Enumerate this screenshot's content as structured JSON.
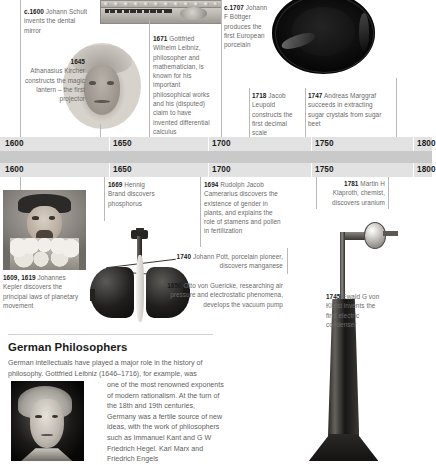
{
  "colors": {
    "axis_bar": "#e2e2e2",
    "axis_gap": "#c9c9c9",
    "body_text": "#6b6b6b",
    "year_text": "#1a1a1a",
    "leader_line": "#b9b9b9"
  },
  "timeline_top": {
    "labels": [
      "1600",
      "1650",
      "1700",
      "1750",
      "1800"
    ],
    "entries": [
      {
        "id": "dental-mirror",
        "year": "c.1600",
        "text": " Johann Schult invents the dental mirror"
      },
      {
        "id": "magic-lantern",
        "year": "1645",
        "text": "Athanasius Kircher constructs the magic lantern – the first projector"
      },
      {
        "id": "leibniz-calculus",
        "year": "1671",
        "text": " Gottfried Wilhelm Leibniz, philosopher and mathematician, is known for his important philosophical works and his (disputed) claim to have invented differential calculus"
      },
      {
        "id": "european-porcelain",
        "year": "c.1707",
        "text": " Johann F Böttger produces the first European porcelain"
      },
      {
        "id": "decimal-scale",
        "year": "1718",
        "text": " Jacob Leupold constructs the first decimal scale"
      },
      {
        "id": "sugar-beet",
        "year": "1747",
        "text": " Andreas Marggraf succeeds in extracting sugar crystals from sugar beet"
      }
    ]
  },
  "timeline_bottom": {
    "labels": [
      "1600",
      "1650",
      "1700",
      "1750",
      "1800"
    ],
    "entries": [
      {
        "id": "kepler-laws",
        "year": "1609, 1619",
        "text": " Johannes Kepler discovers the principal laws of planetary movement"
      },
      {
        "id": "phosphorus",
        "year": "1669",
        "text": " Hennig Brand discovers phosphorus"
      },
      {
        "id": "plant-gender",
        "year": "1694",
        "text": " Rudolph Jacob Camerarius discovers the existence of gender in plants, and explains the role of stamens and pollen in fertilization"
      },
      {
        "id": "manganese",
        "year": "1740",
        "text": " Johann Pott, porcelain pioneer, discovers manganese"
      },
      {
        "id": "vacuum-pump",
        "year": "1650",
        "text": " Otto von Guericke, researching air pressure and electrostatic phenomena, develops the vacuum pump"
      },
      {
        "id": "uranium",
        "year": "1781",
        "text": " Martin H Klaproth, chemist, discovers uranium"
      },
      {
        "id": "electric-condenser",
        "year": "1745",
        "text": " Ewald G von Kleist invents the first electric condenser"
      }
    ]
  },
  "feature": {
    "title": "German Philosophers",
    "paragraph_lead": "German intellectuals have played a major role in the history of philosophy. Gottfried Leibniz (1646–1716), for example, was",
    "paragraph_wrap": "one of the most renowned exponents of modern rationalism. At the turn of the 18th and 19th centuries, Germany was a fertile source of new ideas, with the work of philosophers such as Immanuel Kant and G W Friedrich Hegel. Karl Marx and Friedrich Engels"
  },
  "illustrations": [
    {
      "id": "leibniz-calculating-machine",
      "name": "calculating-machine-illustration"
    },
    {
      "id": "kircher-portrait",
      "name": "kircher-bust-portrait"
    },
    {
      "id": "bottger-plate",
      "name": "black-porcelain-plate-photo"
    },
    {
      "id": "kepler-portrait",
      "name": "kepler-portrait"
    },
    {
      "id": "magdeburg-hemispheres",
      "name": "vacuum-pump-hemispheres-illustration"
    },
    {
      "id": "kleist-condenser",
      "name": "electric-condenser-illustration"
    },
    {
      "id": "hegel-portrait",
      "name": "hegel-portrait"
    }
  ]
}
